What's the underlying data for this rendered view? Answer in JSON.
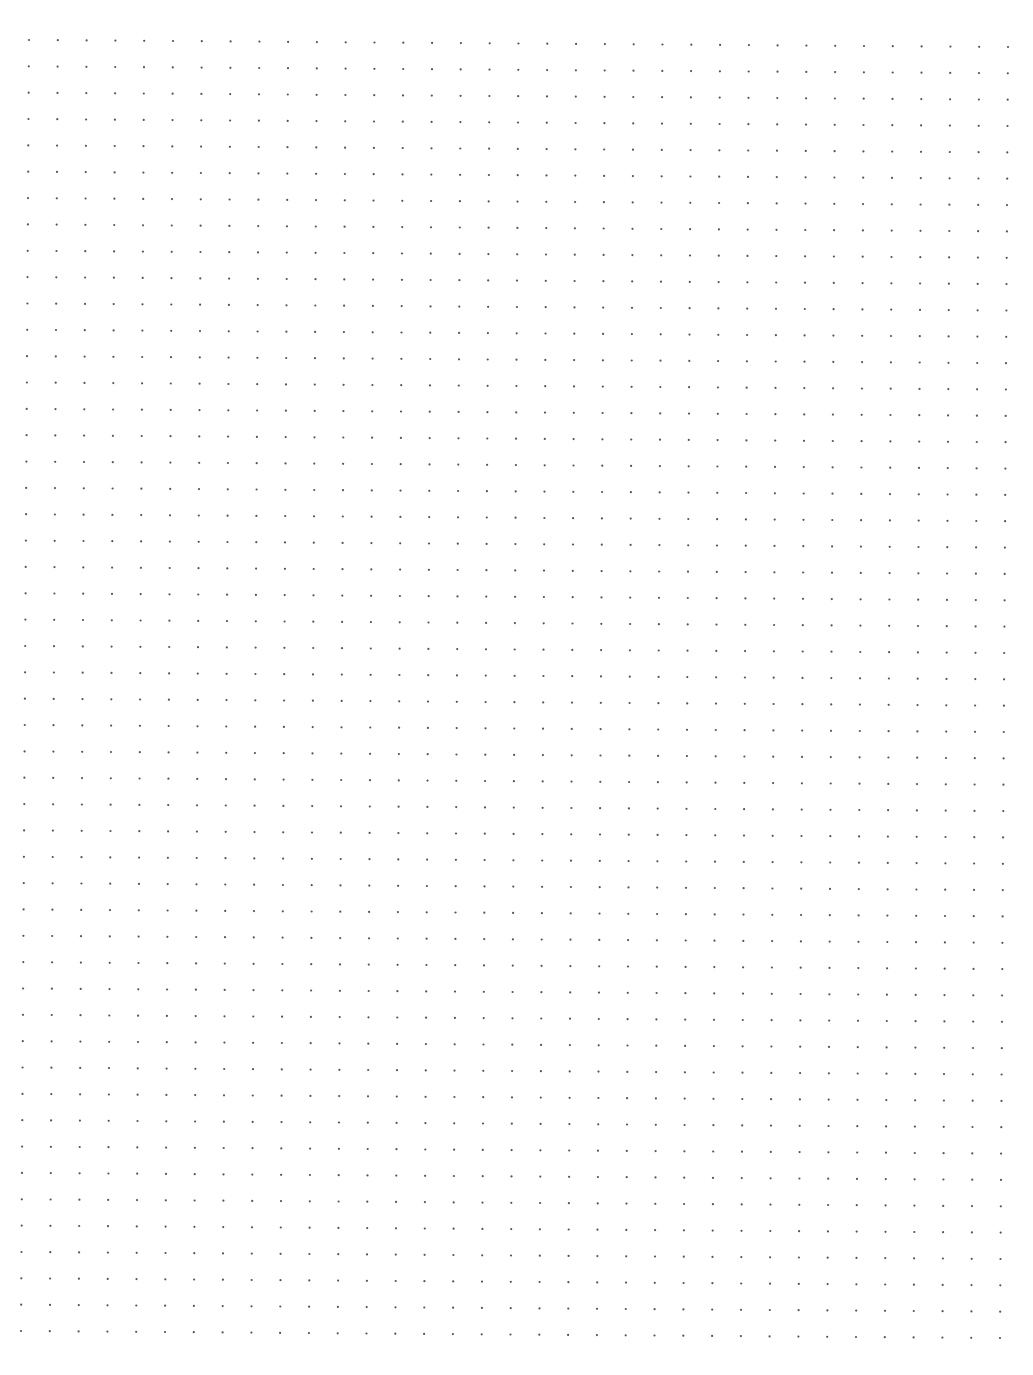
{
  "page": {
    "type": "dot-grid-paper",
    "width": 1033,
    "height": 1375,
    "background_color": "#ffffff",
    "dot_color": "#555555"
  },
  "grid": {
    "columns": 35,
    "rows": 50,
    "top_left": [
      29,
      40
    ],
    "top_right": [
      1008,
      47
    ],
    "bottom_left": [
      21,
      1331
    ],
    "dot_radius": 1.1
  }
}
